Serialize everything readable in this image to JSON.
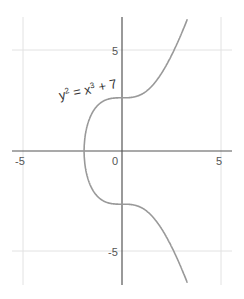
{
  "chart_data": {
    "type": "line",
    "title": "",
    "xlabel": "",
    "ylabel": "",
    "xlim": [
      -5.5,
      5.5
    ],
    "ylim": [
      -6.7,
      6.7
    ],
    "grid": true,
    "x_ticks": [
      "-5",
      "0",
      "5"
    ],
    "y_ticks": [
      "5",
      "-5"
    ],
    "annotation": {
      "base": "y",
      "exp1": "2",
      "mid": " = x",
      "exp2": "3",
      "tail": " + 7"
    },
    "series": [
      {
        "name": "y^2 = x^3 + 7",
        "equation": "y^2 = x^3 + 7",
        "color": "#999999"
      }
    ]
  },
  "colors": {
    "axis": "#555555",
    "grid": "#dddddd",
    "curve": "#999999"
  }
}
